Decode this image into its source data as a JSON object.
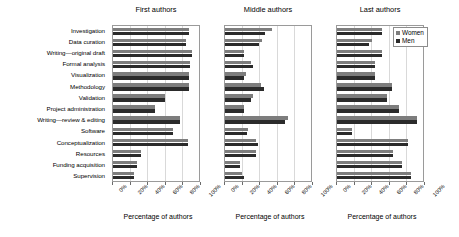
{
  "chart_data": {
    "type": "bar",
    "title": "",
    "orientation": "horizontal",
    "grouped": true,
    "xlabel": "Percentage of authors",
    "ylabel": "",
    "xlim": [
      0,
      100
    ],
    "xticks": [
      "0%",
      "20%",
      "40%",
      "60%",
      "80%",
      "100%"
    ],
    "xtick_values": [
      0,
      20,
      40,
      60,
      80,
      100
    ],
    "grid": true,
    "legend": {
      "position": "top-right-panel-3",
      "entries": [
        {
          "label": "Women",
          "color": "#7d7d7d"
        },
        {
          "label": "Men",
          "color": "#2b2b2b"
        }
      ]
    },
    "categories": [
      "Investigation",
      "Data curation",
      "Writing—original draft",
      "Formal analysis",
      "Visualization",
      "Methodology",
      "Validation",
      "Project administration",
      "Writing—review & editing",
      "Software",
      "Conceptualization",
      "Resources",
      "Funding acquisition",
      "Supervision"
    ],
    "panels": [
      {
        "title": "First authors",
        "xlabel": "Percentage of authors",
        "series": [
          {
            "name": "Women",
            "color": "#7d7d7d",
            "values": [
              88,
              85,
              92,
              89,
              88,
              88,
              61,
              49,
              78,
              70,
              87,
              33,
              28,
              24
            ]
          },
          {
            "name": "Men",
            "color": "#2b2b2b",
            "values": [
              88,
              85,
              92,
              89,
              88,
              88,
              61,
              49,
              78,
              70,
              87,
              33,
              28,
              24
            ]
          }
        ]
      },
      {
        "title": "Middle authors",
        "xlabel": "Percentage of authors",
        "series": [
          {
            "name": "Women",
            "color": "#7d7d7d",
            "values": [
              55,
              43,
              22,
              30,
              24,
              42,
              33,
              22,
              73,
              27,
              36,
              36,
              18,
              20
            ]
          },
          {
            "name": "Men",
            "color": "#2b2b2b",
            "values": [
              47,
              40,
              22,
              33,
              22,
              45,
              30,
              22,
              70,
              25,
              38,
              36,
              17,
              22
            ]
          }
        ]
      },
      {
        "title": "Last authors",
        "xlabel": "Percentage of authors",
        "series": [
          {
            "name": "Women",
            "color": "#7d7d7d",
            "values": [
              52,
              41,
              52,
              44,
              44,
              64,
              58,
              72,
              93,
              18,
              82,
              65,
              76,
              86
            ]
          },
          {
            "name": "Men",
            "color": "#2b2b2b",
            "values": [
              52,
              37,
              52,
              44,
              44,
              64,
              58,
              72,
              93,
              18,
              82,
              65,
              76,
              86
            ]
          }
        ]
      }
    ]
  }
}
